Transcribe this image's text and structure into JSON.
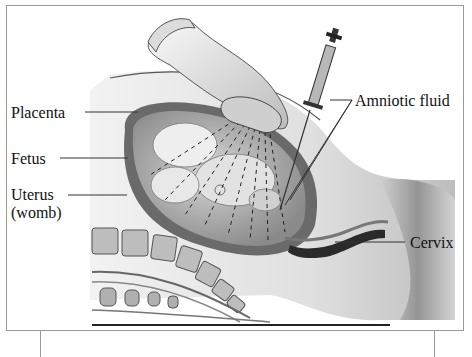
{
  "diagram": {
    "labels": {
      "placenta": "Placenta",
      "fetus": "Fetus",
      "uterus_line1": "Uterus",
      "uterus_line2": "(womb)",
      "amniotic_fluid": "Amniotic fluid",
      "cervix": "Cervix"
    },
    "colors": {
      "ink": "#111111",
      "frame": "#9a9a9a",
      "skin_light": "#e6e6e6",
      "skin_mid": "#c8c8c8",
      "tissue_dark": "#5a5a5a"
    }
  }
}
